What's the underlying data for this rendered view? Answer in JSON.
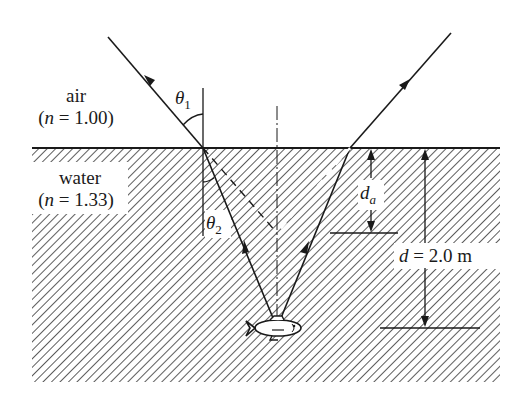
{
  "diagram": {
    "colors": {
      "ink": "#1a1a1a",
      "hatch": "#333333",
      "background": "#ffffff"
    },
    "media": {
      "air": {
        "name": "air",
        "index_label": "(n = 1.00)",
        "n_symbol": "n",
        "n_value": "1.00"
      },
      "water": {
        "name": "water",
        "index_label": "(n = 1.33)",
        "n_symbol": "n",
        "n_value": "1.33"
      }
    },
    "angles": {
      "theta1": {
        "symbol": "θ",
        "subscript": "1"
      },
      "theta2": {
        "symbol": "θ",
        "subscript": "2"
      }
    },
    "dimensions": {
      "apparent_depth": {
        "symbol": "d",
        "subscript": "a"
      },
      "real_depth": {
        "symbol": "d",
        "equals": "=",
        "value": "2.0 m"
      }
    },
    "objects": {
      "fish": "fish-icon"
    }
  }
}
